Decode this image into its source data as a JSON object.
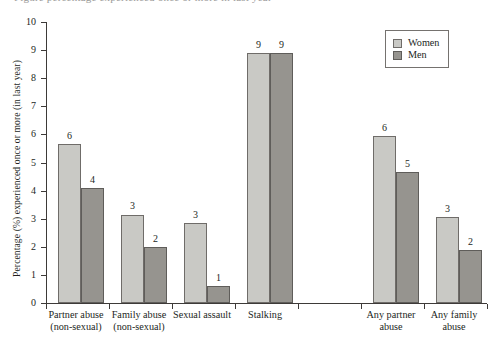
{
  "caption_partial": "Figure  percentage experienced once or more in last year",
  "legend": {
    "position": "top-right",
    "entries": [
      {
        "label": "Women",
        "color": "#c9c9c5"
      },
      {
        "label": "Men",
        "color": "#96948f"
      }
    ]
  },
  "chart_data": {
    "type": "bar",
    "title": "",
    "xlabel": "",
    "ylabel": "Percentage (%) experienced once or more (in last year)",
    "ylim": [
      0,
      10
    ],
    "ytick_labels": [
      "0",
      "1",
      "2",
      "3",
      "4",
      "5",
      "6",
      "7",
      "8",
      "9",
      "10"
    ],
    "grid": false,
    "categories": [
      "Partner abuse\n(non-sexual)",
      "Family abuse\n(non-sexual)",
      "Sexual assault",
      "Stalking",
      "",
      "Any partner\nabuse",
      "Any family\nabuse"
    ],
    "category_lines": [
      [
        "Partner abuse",
        "(non-sexual)"
      ],
      [
        "Family abuse",
        "(non-sexual)"
      ],
      [
        "Sexual assault",
        ""
      ],
      [
        "Stalking",
        ""
      ],
      [
        "",
        ""
      ],
      [
        "Any partner",
        "abuse"
      ],
      [
        "Any family",
        "abuse"
      ]
    ],
    "series": [
      {
        "name": "Women",
        "color": "#c9c9c5",
        "values": [
          5.65,
          3.15,
          2.85,
          8.9,
          null,
          5.95,
          3.05
        ],
        "labels": [
          "6",
          "3",
          "3",
          "9",
          "",
          "6",
          "3"
        ]
      },
      {
        "name": "Men",
        "color": "#96948f",
        "values": [
          4.1,
          2.0,
          0.6,
          8.9,
          null,
          4.65,
          1.9
        ],
        "labels": [
          "4",
          "2",
          "1",
          "9",
          "",
          "5",
          "2"
        ]
      }
    ]
  }
}
